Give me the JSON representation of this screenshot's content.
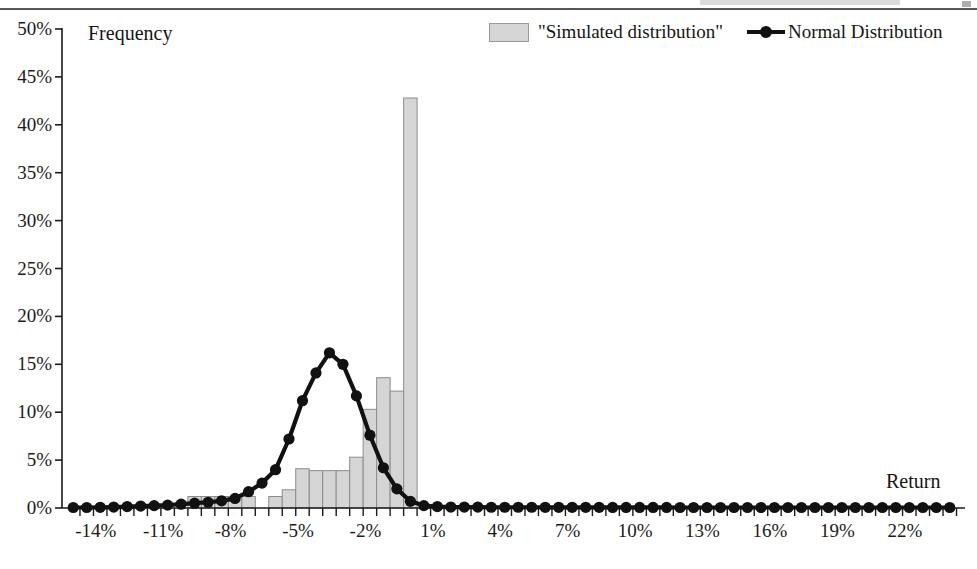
{
  "page": {
    "has_top_rule": true
  },
  "chart_data": {
    "type": "bar",
    "title": "",
    "subtitle": "",
    "xlabel": "Return",
    "ylabel": "Frequency",
    "ylim": [
      0,
      50
    ],
    "ytick_labels": [
      "0%",
      "5%",
      "10%",
      "15%",
      "20%",
      "25%",
      "30%",
      "35%",
      "40%",
      "45%",
      "50%"
    ],
    "ytick_values": [
      0,
      5,
      10,
      15,
      20,
      25,
      30,
      35,
      40,
      45,
      50
    ],
    "xtick_labels": [
      "-14%",
      "-11%",
      "-8%",
      "-5%",
      "-2%",
      "1%",
      "4%",
      "7%",
      "10%",
      "13%",
      "16%",
      "19%",
      "22%"
    ],
    "xtick_values": [
      -14,
      -11,
      -8,
      -5,
      -2,
      1,
      4,
      7,
      10,
      13,
      16,
      19,
      22
    ],
    "xlim": [
      -15.5,
      24.5
    ],
    "grid": false,
    "legend_position": "top-right",
    "legend": [
      {
        "label": "\"Simulated distribution\"",
        "type": "bar",
        "color": "#d5d5d5"
      },
      {
        "label": "Normal Distribution",
        "type": "line-marker",
        "color": "#111111"
      }
    ],
    "x": [
      -15,
      -14.4,
      -13.8,
      -13.2,
      -12.6,
      -12,
      -11.4,
      -10.8,
      -10.2,
      -9.6,
      -9,
      -8.4,
      -7.8,
      -7.2,
      -6.6,
      -6,
      -5.4,
      -4.8,
      -4.2,
      -3.6,
      -3,
      -2.4,
      -1.8,
      -1.2,
      -0.6,
      0,
      0.6,
      1.2,
      1.8,
      2.4,
      3,
      3.6,
      4.2,
      4.8,
      5.4,
      6,
      6.6,
      7.2,
      7.8,
      8.4,
      9,
      9.6,
      10.2,
      10.8,
      11.4,
      12,
      12.6,
      13.2,
      13.8,
      14.4,
      15,
      15.6,
      16.2,
      16.8,
      17.4,
      18,
      18.6,
      19.2,
      19.8,
      20.4,
      21,
      21.6,
      22.2,
      22.8,
      23.4,
      24
    ],
    "series": [
      {
        "name": "\"Simulated distribution\"",
        "type": "bar",
        "color": "#d5d5d5",
        "edge_color": "#8c8c8c",
        "values": [
          0,
          0,
          0,
          0,
          0,
          0,
          0,
          0,
          0,
          1.2,
          1.2,
          1.2,
          1.2,
          1.2,
          0,
          1.2,
          1.9,
          4.1,
          3.9,
          3.9,
          3.9,
          5.3,
          10.3,
          13.6,
          12.2,
          42.8,
          0,
          0,
          0,
          0,
          0,
          0,
          0,
          0,
          0,
          0,
          0,
          0,
          0,
          0,
          0,
          0,
          0,
          0,
          0,
          0,
          0,
          0,
          0,
          0,
          0,
          0,
          0,
          0,
          0,
          0,
          0,
          0,
          0,
          0,
          0,
          0,
          0,
          0,
          0,
          0
        ]
      },
      {
        "name": "Normal Distribution",
        "type": "line",
        "color": "#111111",
        "marker": "circle",
        "values": [
          0.05,
          0.05,
          0.07,
          0.1,
          0.15,
          0.2,
          0.25,
          0.3,
          0.4,
          0.5,
          0.6,
          0.75,
          1.0,
          1.7,
          2.6,
          4.0,
          7.2,
          11.2,
          14.1,
          16.2,
          15.0,
          11.7,
          7.6,
          4.2,
          2.0,
          0.7,
          0.25,
          0.15,
          0.1,
          0.1,
          0.1,
          0.08,
          0.08,
          0.08,
          0.08,
          0.07,
          0.07,
          0.07,
          0.07,
          0.07,
          0.06,
          0.06,
          0.06,
          0.06,
          0.06,
          0.05,
          0.05,
          0.05,
          0.05,
          0.05,
          0.05,
          0.05,
          0.05,
          0.05,
          0.05,
          0.05,
          0.05,
          0.05,
          0.05,
          0.05,
          0.05,
          0.05,
          0.05,
          0.05,
          0.05,
          0.05
        ]
      }
    ]
  }
}
